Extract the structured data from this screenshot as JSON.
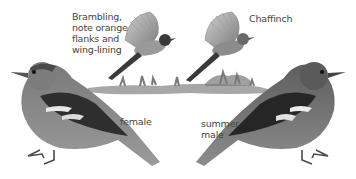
{
  "plate": {
    "labels": {
      "brambling": [
        "Brambling,",
        "note orange",
        "flanks and",
        "wing-lining"
      ],
      "chaffinch": "Chaffinch",
      "female": "female",
      "summer_male": [
        "summer",
        "male"
      ]
    },
    "birds": [
      {
        "name": "brambling-in-flight",
        "pose": "flying"
      },
      {
        "name": "chaffinch-in-flight",
        "pose": "flying"
      },
      {
        "name": "chaffinch-female",
        "pose": "perched, facing left"
      },
      {
        "name": "chaffinch-summer-male",
        "pose": "perched, facing right"
      }
    ],
    "colors": {
      "background": "#ffffff",
      "ink_dark": "#2a2a2a",
      "ink_mid": "#6e6e6e",
      "ink_light": "#a8a8a8",
      "text": "#444444"
    }
  }
}
